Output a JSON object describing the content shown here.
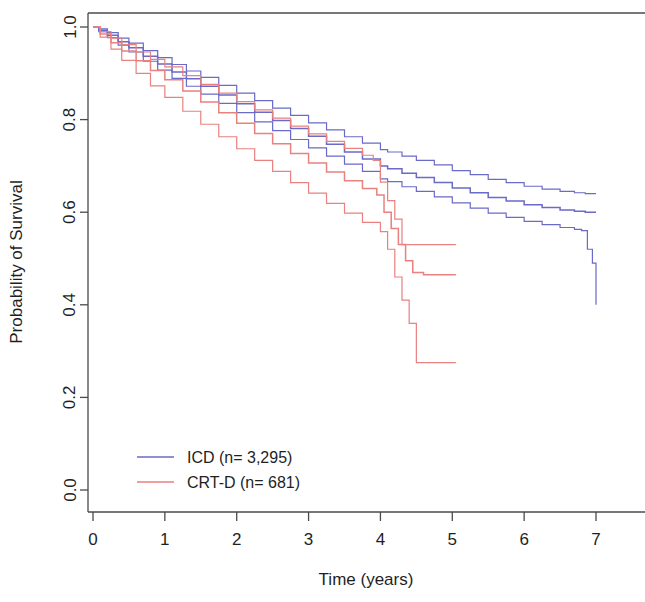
{
  "chart_data": {
    "type": "line",
    "title": "",
    "xlabel": "Time (years)",
    "ylabel": "Probability of Survival",
    "xlim": [
      0,
      7.1
    ],
    "ylim": [
      0,
      1.03
    ],
    "xticks": [
      "0",
      "1",
      "2",
      "3",
      "4",
      "5",
      "6",
      "7"
    ],
    "xtick_values": [
      0,
      1,
      2,
      3,
      4,
      5,
      6,
      7
    ],
    "yticks": [
      "0.0",
      "0.2",
      "0.4",
      "0.6",
      "0.8",
      "1.0"
    ],
    "ytick_values": [
      0.0,
      0.2,
      0.4,
      0.6,
      0.8,
      1.0
    ],
    "grid": false,
    "legend_position": "bottom-left",
    "colors": {
      "icd": "#6a6ac8",
      "crtd": "#e8817f",
      "axis": "#4a4a4a",
      "text": "#1f1f1f",
      "background": "#ffffff"
    },
    "series": [
      {
        "name": "ICD (n= 3,295)",
        "color": "#6a6ac8",
        "role": "estimate",
        "x": [
          0,
          0.08,
          0.2,
          0.35,
          0.5,
          0.7,
          0.9,
          1.1,
          1.3,
          1.5,
          1.75,
          2.0,
          2.25,
          2.5,
          2.75,
          3.0,
          3.25,
          3.5,
          3.75,
          4.0,
          4.1,
          4.3,
          4.5,
          4.75,
          5.0,
          5.25,
          5.5,
          5.75,
          6.0,
          6.25,
          6.5,
          6.7,
          6.85,
          6.95,
          7.0
        ],
        "y": [
          1.0,
          0.993,
          0.982,
          0.968,
          0.955,
          0.937,
          0.92,
          0.903,
          0.888,
          0.872,
          0.853,
          0.834,
          0.816,
          0.798,
          0.781,
          0.764,
          0.747,
          0.73,
          0.715,
          0.7,
          0.694,
          0.684,
          0.675,
          0.664,
          0.652,
          0.642,
          0.632,
          0.624,
          0.616,
          0.61,
          0.605,
          0.602,
          0.6,
          0.6,
          0.6
        ]
      },
      {
        "name": "ICD upper 95% CI",
        "color": "#6a6ac8",
        "role": "ci-upper",
        "x": [
          0,
          0.08,
          0.2,
          0.35,
          0.5,
          0.7,
          0.9,
          1.1,
          1.3,
          1.5,
          1.75,
          2.0,
          2.25,
          2.5,
          2.75,
          3.0,
          3.25,
          3.5,
          3.75,
          4.0,
          4.1,
          4.3,
          4.5,
          4.75,
          5.0,
          5.25,
          5.5,
          5.75,
          6.0,
          6.25,
          6.5,
          6.7,
          6.85,
          6.9,
          7.0
        ],
        "y": [
          1.0,
          0.996,
          0.988,
          0.976,
          0.965,
          0.949,
          0.934,
          0.919,
          0.905,
          0.891,
          0.874,
          0.857,
          0.841,
          0.825,
          0.809,
          0.793,
          0.778,
          0.763,
          0.749,
          0.735,
          0.73,
          0.721,
          0.712,
          0.702,
          0.69,
          0.681,
          0.671,
          0.664,
          0.656,
          0.65,
          0.645,
          0.642,
          0.64,
          0.64,
          0.64
        ]
      },
      {
        "name": "ICD lower 95% CI",
        "color": "#6a6ac8",
        "role": "ci-lower",
        "x": [
          0,
          0.08,
          0.2,
          0.35,
          0.5,
          0.7,
          0.9,
          1.1,
          1.3,
          1.5,
          1.75,
          2.0,
          2.25,
          2.5,
          2.75,
          3.0,
          3.25,
          3.5,
          3.75,
          4.0,
          4.1,
          4.3,
          4.5,
          4.75,
          5.0,
          5.25,
          5.5,
          5.75,
          6.0,
          6.25,
          6.5,
          6.7,
          6.8,
          6.88,
          6.95,
          7.0
        ],
        "y": [
          1.0,
          0.99,
          0.977,
          0.961,
          0.946,
          0.926,
          0.907,
          0.889,
          0.872,
          0.855,
          0.835,
          0.815,
          0.795,
          0.776,
          0.757,
          0.739,
          0.721,
          0.704,
          0.688,
          0.672,
          0.666,
          0.655,
          0.645,
          0.633,
          0.62,
          0.609,
          0.598,
          0.589,
          0.58,
          0.573,
          0.567,
          0.563,
          0.56,
          0.52,
          0.49,
          0.4
        ]
      },
      {
        "name": "CRT-D (n= 681)",
        "color": "#e8817f",
        "role": "estimate",
        "x": [
          0,
          0.1,
          0.25,
          0.4,
          0.6,
          0.8,
          1.0,
          1.25,
          1.5,
          1.75,
          2.0,
          2.25,
          2.5,
          2.75,
          3.0,
          3.25,
          3.5,
          3.75,
          3.95,
          4.05,
          4.15,
          4.25,
          4.35,
          4.45,
          4.6,
          5.05
        ],
        "y": [
          1.0,
          0.985,
          0.966,
          0.948,
          0.927,
          0.906,
          0.886,
          0.862,
          0.838,
          0.815,
          0.792,
          0.77,
          0.748,
          0.727,
          0.706,
          0.687,
          0.668,
          0.651,
          0.637,
          0.6,
          0.565,
          0.53,
          0.495,
          0.47,
          0.465,
          0.465
        ]
      },
      {
        "name": "CRT-D upper 95% CI",
        "color": "#e8817f",
        "role": "ci-upper",
        "x": [
          0,
          0.1,
          0.25,
          0.4,
          0.6,
          0.8,
          1.0,
          1.25,
          1.5,
          1.75,
          2.0,
          2.25,
          2.5,
          2.75,
          3.0,
          3.25,
          3.5,
          3.75,
          3.9,
          4.0,
          4.1,
          4.2,
          4.3,
          5.05
        ],
        "y": [
          1.0,
          0.99,
          0.976,
          0.962,
          0.946,
          0.93,
          0.914,
          0.895,
          0.876,
          0.857,
          0.839,
          0.821,
          0.803,
          0.786,
          0.769,
          0.753,
          0.738,
          0.723,
          0.712,
          0.665,
          0.625,
          0.585,
          0.53,
          0.53
        ]
      },
      {
        "name": "CRT-D lower 95% CI",
        "color": "#e8817f",
        "role": "ci-lower",
        "x": [
          0,
          0.1,
          0.25,
          0.4,
          0.6,
          0.8,
          1.0,
          1.25,
          1.5,
          1.75,
          2.0,
          2.25,
          2.5,
          2.75,
          3.0,
          3.25,
          3.5,
          3.75,
          4.0,
          4.1,
          4.2,
          4.3,
          4.4,
          4.5,
          5.05
        ],
        "y": [
          1.0,
          0.978,
          0.952,
          0.928,
          0.9,
          0.873,
          0.848,
          0.818,
          0.79,
          0.763,
          0.737,
          0.712,
          0.688,
          0.664,
          0.641,
          0.619,
          0.598,
          0.578,
          0.558,
          0.52,
          0.46,
          0.41,
          0.36,
          0.275,
          0.275
        ]
      }
    ],
    "legend": [
      {
        "label": "ICD (n= 3,295)",
        "color": "#6a6ac8"
      },
      {
        "label": "CRT-D (n= 681)",
        "color": "#e8817f"
      }
    ]
  }
}
